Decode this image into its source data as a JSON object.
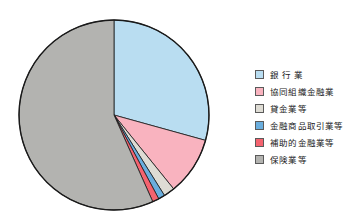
{
  "chart_data": {
    "type": "pie",
    "title": "",
    "subtitle": "",
    "xlabel": "",
    "ylabel": "",
    "legend_position": "right",
    "grid": false,
    "start_angle_deg": 0,
    "direction": "clockwise",
    "categories": [
      "銀 行 業",
      "協同組織金融業",
      "貸金業等",
      "金融商品取引業等",
      "補助的金融業等",
      "保険業等"
    ],
    "values": [
      29.3,
      9.9,
      1.9,
      1.1,
      1.1,
      56.7
    ],
    "angles_deg": [
      105.5,
      35.6,
      6.8,
      4.0,
      4.0,
      204.1
    ],
    "colors": [
      "#b9ddf1",
      "#f9b3bf",
      "#dedcd4",
      "#6aaede",
      "#f4636f",
      "#b3b3b0"
    ]
  },
  "legend": {
    "items": [
      {
        "label": "銀 行 業",
        "color": "#b9ddf1"
      },
      {
        "label": "協同組織金融業",
        "color": "#f9b3bf"
      },
      {
        "label": "貸金業等",
        "color": "#dedcd4"
      },
      {
        "label": "金融商品取引業等",
        "color": "#6aaede"
      },
      {
        "label": "補助的金融業等",
        "color": "#f4636f"
      },
      {
        "label": "保険業等",
        "color": "#b3b3b0"
      }
    ]
  },
  "pie": {
    "center_x": 114,
    "center_y": 115,
    "radius": 95,
    "outline_color": "#1a1a1a"
  }
}
